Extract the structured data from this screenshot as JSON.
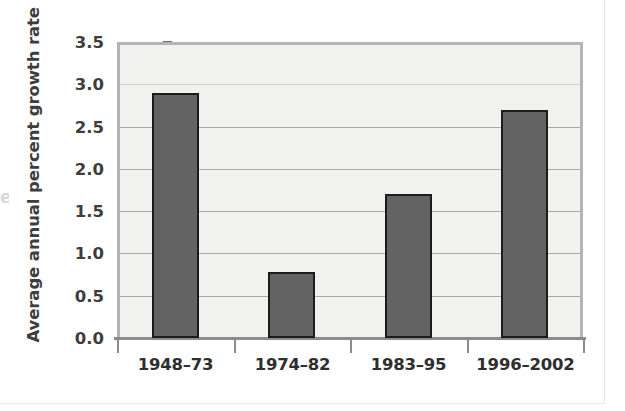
{
  "figure": {
    "background_color": "#ffffff",
    "plot_background_color": "#f1f1f0",
    "frame_color": "#b4b4b4",
    "gridline_color": "#a9a9a9",
    "bar_fill_color": "#636363",
    "bar_outline_color": "#1c1c1c",
    "text_color": "#3d3d3d"
  },
  "edge_artifact": {
    "glyph": "e"
  },
  "chart_data": {
    "type": "bar",
    "title": "",
    "xlabel": "",
    "ylabel": "Average annual percent growth rate",
    "categories": [
      "1948–73",
      "1974–82",
      "1983–95",
      "1996–2002"
    ],
    "values": [
      2.9,
      0.78,
      1.7,
      2.7
    ],
    "ylim": [
      0.0,
      3.5
    ],
    "ytick_labels": [
      "0.0",
      "0.5",
      "1.0",
      "1.5",
      "2.0",
      "2.5",
      "3.0",
      "3.5"
    ],
    "ytick_values": [
      0.0,
      0.5,
      1.0,
      1.5,
      2.0,
      2.5,
      3.0,
      3.5
    ],
    "grid": true,
    "grid_axis": "y",
    "legend": false,
    "legend_position": "none",
    "series": [
      {
        "name": "Average annual percent growth rate",
        "values": [
          2.9,
          0.78,
          1.7,
          2.7
        ]
      }
    ]
  }
}
